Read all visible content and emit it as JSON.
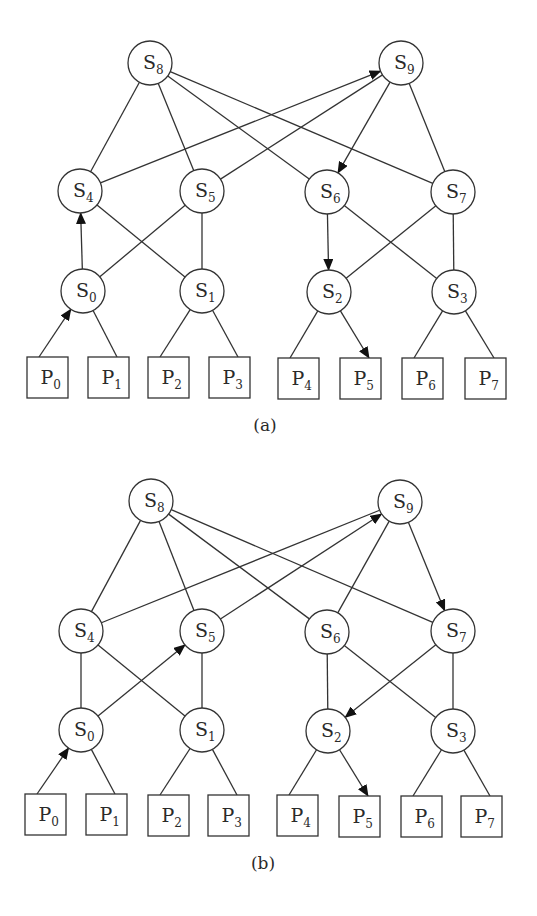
{
  "figure": {
    "colors": {
      "stroke": "#333333",
      "text": "#2a2a2a",
      "background": "#ffffff",
      "arrow": "#111111"
    },
    "node_radius": 22,
    "box_size": {
      "w": 41,
      "h": 41
    },
    "panels": [
      {
        "id": "a",
        "caption": "(a)",
        "caption_pos": [
          265,
          431
        ],
        "switches": [
          {
            "id": "S8",
            "base": "S",
            "sub": "8",
            "x": 150,
            "y": 63
          },
          {
            "id": "S9",
            "base": "S",
            "sub": "9",
            "x": 401,
            "y": 63
          },
          {
            "id": "S4",
            "base": "S",
            "sub": "4",
            "x": 80,
            "y": 191
          },
          {
            "id": "S5",
            "base": "S",
            "sub": "5",
            "x": 202,
            "y": 191
          },
          {
            "id": "S6",
            "base": "S",
            "sub": "6",
            "x": 327,
            "y": 192
          },
          {
            "id": "S7",
            "base": "S",
            "sub": "7",
            "x": 453,
            "y": 192
          },
          {
            "id": "S0",
            "base": "S",
            "sub": "0",
            "x": 83,
            "y": 291
          },
          {
            "id": "S1",
            "base": "S",
            "sub": "1",
            "x": 202,
            "y": 291
          },
          {
            "id": "S2",
            "base": "S",
            "sub": "2",
            "x": 329,
            "y": 292
          },
          {
            "id": "S3",
            "base": "S",
            "sub": "3",
            "x": 454,
            "y": 292
          }
        ],
        "processors": [
          {
            "id": "P0",
            "base": "P",
            "sub": "0",
            "x": 27,
            "y": 357
          },
          {
            "id": "P1",
            "base": "P",
            "sub": "1",
            "x": 88,
            "y": 357
          },
          {
            "id": "P2",
            "base": "P",
            "sub": "2",
            "x": 148,
            "y": 357
          },
          {
            "id": "P3",
            "base": "P",
            "sub": "3",
            "x": 209,
            "y": 357
          },
          {
            "id": "P4",
            "base": "P",
            "sub": "4",
            "x": 278,
            "y": 358
          },
          {
            "id": "P5",
            "base": "P",
            "sub": "5",
            "x": 340,
            "y": 358
          },
          {
            "id": "P6",
            "base": "P",
            "sub": "6",
            "x": 402,
            "y": 358
          },
          {
            "id": "P7",
            "base": "P",
            "sub": "7",
            "x": 465,
            "y": 358
          }
        ],
        "edges": [
          {
            "from": "S8",
            "to": "S4"
          },
          {
            "from": "S8",
            "to": "S5"
          },
          {
            "from": "S8",
            "to": "S6"
          },
          {
            "from": "S8",
            "to": "S7"
          },
          {
            "from": "S4",
            "to": "S9",
            "arrow": true
          },
          {
            "from": "S9",
            "to": "S5"
          },
          {
            "from": "S9",
            "to": "S6",
            "arrow": true
          },
          {
            "from": "S9",
            "to": "S7"
          },
          {
            "from": "S0",
            "to": "S4",
            "arrow": true
          },
          {
            "from": "S4",
            "to": "S1"
          },
          {
            "from": "S0",
            "to": "S5"
          },
          {
            "from": "S5",
            "to": "S1"
          },
          {
            "from": "S6",
            "to": "S2",
            "arrow": true
          },
          {
            "from": "S6",
            "to": "S3"
          },
          {
            "from": "S7",
            "to": "S2"
          },
          {
            "from": "S7",
            "to": "S3"
          },
          {
            "from": "P0",
            "to": "S0",
            "arrow": true
          },
          {
            "from": "P1",
            "to": "S0"
          },
          {
            "from": "P2",
            "to": "S1"
          },
          {
            "from": "P3",
            "to": "S1"
          },
          {
            "from": "P4",
            "to": "S2"
          },
          {
            "from": "S2",
            "to": "P5",
            "arrow": true
          },
          {
            "from": "P6",
            "to": "S3"
          },
          {
            "from": "P7",
            "to": "S3"
          }
        ]
      },
      {
        "id": "b",
        "caption": "(b)",
        "caption_pos": [
          263,
          869
        ],
        "switches": [
          {
            "id": "S8",
            "base": "S",
            "sub": "8",
            "x": 151,
            "y": 501
          },
          {
            "id": "S9",
            "base": "S",
            "sub": "9",
            "x": 400,
            "y": 502
          },
          {
            "id": "S4",
            "base": "S",
            "sub": "4",
            "x": 81,
            "y": 631
          },
          {
            "id": "S5",
            "base": "S",
            "sub": "5",
            "x": 202,
            "y": 631
          },
          {
            "id": "S6",
            "base": "S",
            "sub": "6",
            "x": 327,
            "y": 632
          },
          {
            "id": "S7",
            "base": "S",
            "sub": "7",
            "x": 453,
            "y": 631
          },
          {
            "id": "S0",
            "base": "S",
            "sub": "0",
            "x": 81,
            "y": 730
          },
          {
            "id": "S1",
            "base": "S",
            "sub": "1",
            "x": 202,
            "y": 730
          },
          {
            "id": "S2",
            "base": "S",
            "sub": "2",
            "x": 328,
            "y": 731
          },
          {
            "id": "S3",
            "base": "S",
            "sub": "3",
            "x": 453,
            "y": 731
          }
        ],
        "processors": [
          {
            "id": "P0",
            "base": "P",
            "sub": "0",
            "x": 25,
            "y": 794
          },
          {
            "id": "P1",
            "base": "P",
            "sub": "1",
            "x": 86,
            "y": 794
          },
          {
            "id": "P2",
            "base": "P",
            "sub": "2",
            "x": 148,
            "y": 795
          },
          {
            "id": "P3",
            "base": "P",
            "sub": "3",
            "x": 208,
            "y": 795
          },
          {
            "id": "P4",
            "base": "P",
            "sub": "4",
            "x": 277,
            "y": 795
          },
          {
            "id": "P5",
            "base": "P",
            "sub": "5",
            "x": 339,
            "y": 796
          },
          {
            "id": "P6",
            "base": "P",
            "sub": "6",
            "x": 401,
            "y": 796
          },
          {
            "id": "P7",
            "base": "P",
            "sub": "7",
            "x": 461,
            "y": 796
          }
        ],
        "edges": [
          {
            "from": "S8",
            "to": "S4"
          },
          {
            "from": "S8",
            "to": "S5"
          },
          {
            "from": "S8",
            "to": "S6"
          },
          {
            "from": "S8",
            "to": "S7"
          },
          {
            "from": "S4",
            "to": "S9"
          },
          {
            "from": "S5",
            "to": "S9",
            "arrow": true
          },
          {
            "from": "S9",
            "to": "S6"
          },
          {
            "from": "S9",
            "to": "S7",
            "arrow": true
          },
          {
            "from": "S4",
            "to": "S0"
          },
          {
            "from": "S4",
            "to": "S1"
          },
          {
            "from": "S0",
            "to": "S5",
            "arrow": true
          },
          {
            "from": "S5",
            "to": "S1"
          },
          {
            "from": "S6",
            "to": "S2"
          },
          {
            "from": "S6",
            "to": "S3"
          },
          {
            "from": "S7",
            "to": "S2",
            "arrow": true
          },
          {
            "from": "S7",
            "to": "S3"
          },
          {
            "from": "P0",
            "to": "S0",
            "arrow": true
          },
          {
            "from": "P1",
            "to": "S0"
          },
          {
            "from": "P2",
            "to": "S1"
          },
          {
            "from": "P3",
            "to": "S1"
          },
          {
            "from": "P4",
            "to": "S2"
          },
          {
            "from": "S2",
            "to": "P5",
            "arrow": true
          },
          {
            "from": "P6",
            "to": "S3"
          },
          {
            "from": "P7",
            "to": "S3"
          }
        ]
      }
    ]
  }
}
